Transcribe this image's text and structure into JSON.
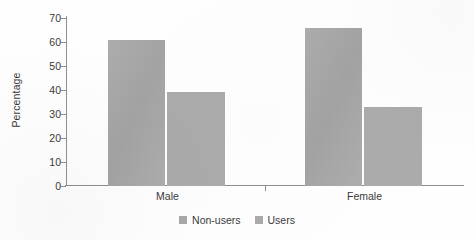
{
  "chart_data": {
    "type": "bar",
    "title": "",
    "subtitle": "",
    "xlabel": "",
    "ylabel": "Percentage",
    "categories": [
      "Male",
      "Female"
    ],
    "series": [
      {
        "name": "Non-users",
        "values": [
          61,
          66
        ],
        "color": "#a8a8a8"
      },
      {
        "name": "Users",
        "values": [
          39,
          33
        ],
        "color": "#ababab"
      }
    ],
    "ylim": [
      0,
      70
    ],
    "ytick_step": 10,
    "ytick_labels": [
      "0",
      "10",
      "20",
      "30",
      "40",
      "50",
      "60",
      "70"
    ],
    "ytick_values": [
      0,
      10,
      20,
      30,
      40,
      50,
      60,
      70
    ],
    "grid": false,
    "legend_position": "bottom-center",
    "orientation": "vertical",
    "grouping": "grouped",
    "annotations": []
  },
  "legend": {
    "items": [
      {
        "label": "Non-users"
      },
      {
        "label": "Users"
      }
    ]
  },
  "axis": {
    "y_label": "Percentage",
    "x_categories": [
      "Male",
      "Female"
    ]
  }
}
